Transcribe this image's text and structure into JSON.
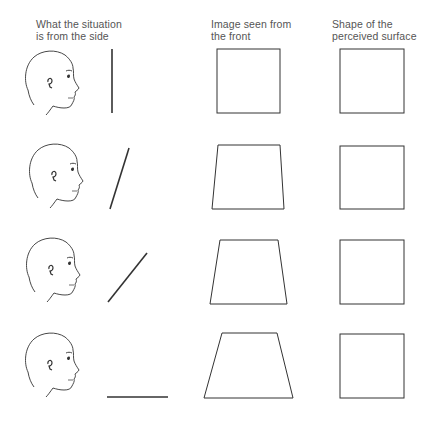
{
  "columns": [
    {
      "line1": "What the situation",
      "line2": "is from the side"
    },
    {
      "line1": "Image seen from",
      "line2": "the front"
    },
    {
      "line1": "Shape of the",
      "line2": "perceived surface"
    }
  ],
  "rows": [
    {
      "surface_orientation": "vertical",
      "front_image": "square",
      "perceived_shape": "square"
    },
    {
      "surface_orientation": "tilted slightly",
      "front_image": "slight trapezoid",
      "perceived_shape": "square"
    },
    {
      "surface_orientation": "tilted about 45 degrees",
      "front_image": "trapezoid",
      "perceived_shape": "square"
    },
    {
      "surface_orientation": "horizontal",
      "front_image": "strong trapezoid",
      "perceived_shape": "square"
    }
  ],
  "colors": {
    "line": "#333333",
    "text": "#555555",
    "background": "#ffffff"
  }
}
